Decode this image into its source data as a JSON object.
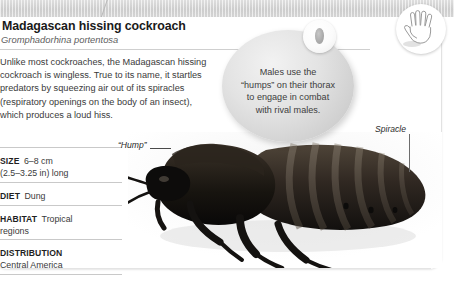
{
  "page": {
    "kind": "encyclopedia-species-card",
    "banner_color": "#d4d4d4",
    "card_color": "#ffffff"
  },
  "header": {
    "title": "Madagascan hissing cockroach",
    "scientific_name": "Gromphadorhina portentosa"
  },
  "body": {
    "paragraph": "Unlike most cockroaches, the Madagascan hissing cockroach is wingless. True to its name, it startles predators by squeezing air out of its spiracles (respiratory openings on the body of an insect), which produces a loud hiss."
  },
  "facts": [
    {
      "key": "SIZE",
      "value": "6–8 cm",
      "extra": "(2.5–3.25 in) long"
    },
    {
      "key": "DIET",
      "value": "Dung",
      "extra": ""
    },
    {
      "key": "HABITAT",
      "value": "Tropical",
      "extra": "regions"
    },
    {
      "key": "DISTRIBUTION",
      "value": "",
      "extra": "Central America"
    }
  ],
  "callout": {
    "line1": "Males use the",
    "line2": "“humps” on their thorax",
    "line3": "to engage in combat",
    "line4": "with rival males.",
    "inset_icon": "spiracle-closeup-icon"
  },
  "annotations": {
    "hump_label": "“Hump”",
    "spiracle_label": "Spiracle"
  },
  "size_badge": {
    "icon": "open-hand-icon",
    "meaning": "hand-scale-comparison"
  },
  "photo": {
    "subject": "Madagascan hissing cockroach",
    "alt": "Dark brown segmented cockroach in profile facing left"
  }
}
